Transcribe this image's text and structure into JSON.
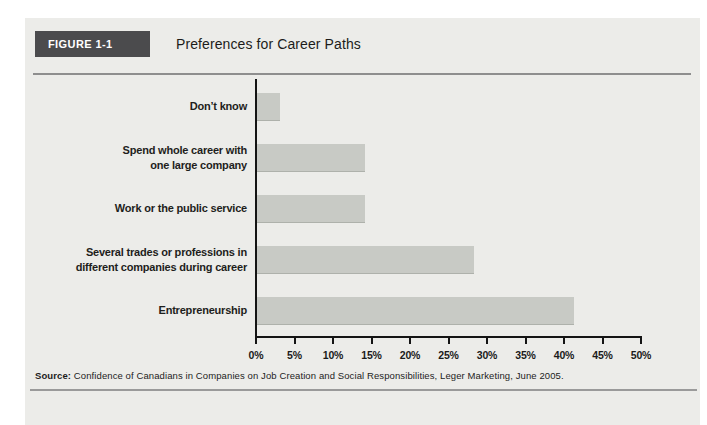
{
  "figure": {
    "tag": "FIGURE 1-1",
    "title": "Preferences for Career Paths"
  },
  "source": {
    "label": "Source:",
    "text": " Confidence of Canadians in Companies on Job Creation and Social Responsibilities, Leger Marketing, June 2005."
  },
  "colors": {
    "panel_bg": "#ecece9",
    "bar": "#c8cac5",
    "bar_edge": "#aeb1ab",
    "figure_tag_bg": "#4b4b4d",
    "figure_tag_text": "#ffffff",
    "axis": "#141414",
    "rule": "#8e8e8e"
  },
  "chart_data": {
    "type": "bar",
    "orientation": "horizontal",
    "title": "Preferences for Career Paths",
    "categories": [
      "Don’t know",
      "Spend whole career with\none large company",
      "Work or the public service",
      "Several trades or professions in\ndifferent companies during career",
      "Entrepreneurship"
    ],
    "values": [
      3,
      14,
      14,
      28,
      41
    ],
    "unit": "%",
    "xlabel": "",
    "ylabel": "",
    "xlim": [
      0,
      50
    ],
    "x_tick_step": 5,
    "x_ticks": [
      "0%",
      "5%",
      "10%",
      "15%",
      "20%",
      "25%",
      "30%",
      "35%",
      "40%",
      "45%",
      "50%"
    ],
    "grid": false,
    "legend": false
  }
}
